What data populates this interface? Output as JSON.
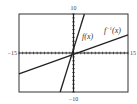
{
  "chart_data": {
    "type": "line",
    "title": "",
    "xlabel": "",
    "ylabel": "",
    "xlim": [
      -15,
      15
    ],
    "ylim": [
      -10,
      10
    ],
    "grid": false,
    "tick_labels": {
      "x_min": "−15",
      "x_max": "15",
      "y_min": "−10",
      "y_max": "10"
    },
    "series": [
      {
        "name": "f(x)",
        "label": "f(x)",
        "equation": "y = 3x + 1",
        "x": [
          -3.67,
          3
        ],
        "y": [
          -10,
          10
        ]
      },
      {
        "name": "f^-1(x)",
        "label": "f",
        "label_sup": "−1",
        "label_tail": "(x)",
        "equation": "y = (x − 1)/3",
        "x": [
          -15,
          15
        ],
        "y": [
          -5.33,
          4.67
        ]
      }
    ]
  }
}
